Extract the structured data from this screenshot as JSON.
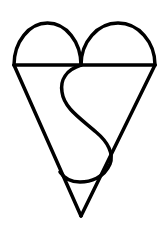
{
  "figure": {
    "stroke_color": "#000000",
    "background_color": "#ffffff",
    "stroke_width": 3.5
  }
}
